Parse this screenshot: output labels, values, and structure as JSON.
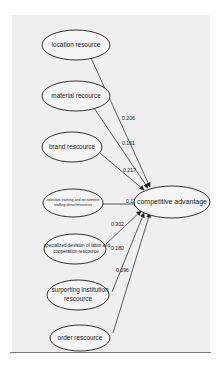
{
  "diagram": {
    "type": "path-model",
    "target": {
      "label": "competitive advantage"
    },
    "nodes": [
      {
        "id": "location",
        "lines": [
          "location resource"
        ]
      },
      {
        "id": "material",
        "lines": [
          "material recource"
        ]
      },
      {
        "id": "brand",
        "lines": [
          "brand rescource"
        ]
      },
      {
        "id": "selective",
        "lines": [
          "selective training and recruitment",
          "staffing ideas/resources"
        ]
      },
      {
        "id": "specialized",
        "lines": [
          "specialized devision of labor and",
          "cooperation rescource"
        ]
      },
      {
        "id": "surporting",
        "lines": [
          "surporting institution",
          "rescource"
        ]
      },
      {
        "id": "order",
        "lines": [
          "order rescource"
        ]
      }
    ],
    "edges": [
      {
        "from": "location",
        "to": "target",
        "coefficient": "0.206"
      },
      {
        "from": "material",
        "to": "target",
        "coefficient": "0.161"
      },
      {
        "from": "brand",
        "to": "target",
        "coefficient": "0.217"
      },
      {
        "from": "selective",
        "to": "target",
        "coefficient": "0.117"
      },
      {
        "from": "specialized",
        "to": "target",
        "coefficient": "0.302"
      },
      {
        "from": "surporting",
        "to": "target",
        "coefficient": "0.180"
      },
      {
        "from": "order",
        "to": "target",
        "coefficient": "0.096"
      }
    ]
  }
}
